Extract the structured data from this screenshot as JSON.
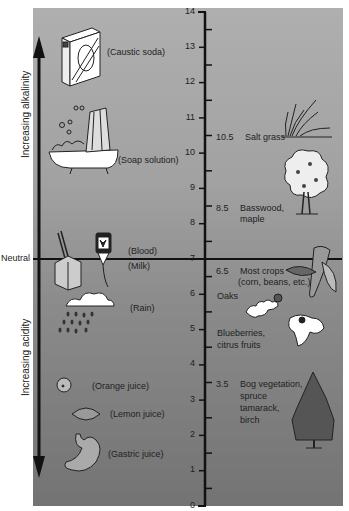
{
  "diagram": {
    "type": "pH scale",
    "axis": {
      "min": 0,
      "max": 14,
      "ticks": [
        "0",
        "1",
        "2",
        "3",
        "4",
        "5",
        "6",
        "7",
        "8",
        "9",
        "10",
        "11",
        "12",
        "13",
        "14"
      ],
      "neutral_value": 7
    },
    "left_labels": {
      "alkalinity": "Increasing alkalinity",
      "acidity": "Increasing acidity",
      "neutral": "Neutral"
    },
    "substances": [
      {
        "label": "(Caustic soda)",
        "icon": "caustic-soda-box-icon"
      },
      {
        "label": "(Soap solution)",
        "icon": "bathtub-icon"
      },
      {
        "label": "(Blood)",
        "icon": "blood-bag-icon"
      },
      {
        "label": "(Milk)",
        "icon": "milk-carton-icon"
      },
      {
        "label": "(Rain)",
        "icon": "rain-cloud-icon"
      },
      {
        "label": "(Orange juice)",
        "icon": "orange-icon"
      },
      {
        "label": "(Lemon juice)",
        "icon": "lemon-icon"
      },
      {
        "label": "(Gastric juice)",
        "icon": "stomach-icon"
      }
    ],
    "plants": [
      {
        "value": "10.5",
        "label": "Salt grass",
        "icon": "grass-icon"
      },
      {
        "value": "8.5",
        "label": "Basswood,",
        "label2": "maple",
        "icon": "deciduous-tree-icon"
      },
      {
        "value": "6.5",
        "label": "Most crops",
        "label2": "(corn, beans, etc.)",
        "icon": "corn-icon"
      },
      {
        "value": "",
        "label": "Oaks",
        "icon": "oak-leaf-icon"
      },
      {
        "value": "",
        "label": "Blueberries,",
        "label2": "citrus fruits",
        "icon": "leaf-icon"
      },
      {
        "value": "3.5",
        "label": "Bog vegetation,",
        "label2": "spruce",
        "label3": "tamarack,",
        "label4": "birch",
        "icon": "spruce-tree-icon"
      }
    ]
  }
}
